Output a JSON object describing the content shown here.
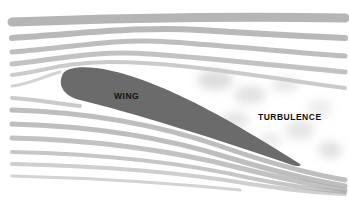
{
  "diagram": {
    "labels": {
      "wing": "WING",
      "turbulence": "TURBULENCE"
    },
    "colors": {
      "background": "#ffffff",
      "wing_fill": "#6b6b6b",
      "flow_lines": "#a9a9a9",
      "turbulence": "#cfcfcf",
      "text": "#111111"
    },
    "elements": [
      {
        "id": "wing",
        "type": "airfoil",
        "leading_edge": [
          60,
          82
        ],
        "trailing_edge": [
          300,
          166
        ]
      },
      {
        "id": "flow-lines-upper",
        "type": "streamlines",
        "count": 6
      },
      {
        "id": "flow-lines-lower",
        "type": "streamlines",
        "count": 6
      },
      {
        "id": "turbulence-region",
        "type": "wake",
        "region": [
          180,
          60,
          345,
          190
        ]
      }
    ]
  }
}
